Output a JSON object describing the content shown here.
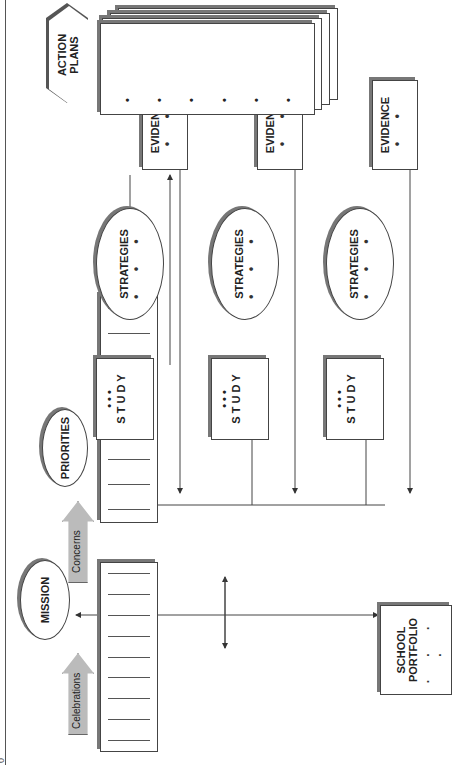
{
  "diagram": {
    "orientation": "rotated 90 degrees counter-clockwise",
    "mission": {
      "label": "MISSION"
    },
    "priorities": {
      "label": "PRIORITIES"
    },
    "celebrations": {
      "label": "Celebrations"
    },
    "concerns": {
      "label": "Concerns"
    },
    "school_portfolio": {
      "line1": "SCHOOL",
      "line2": "PORTFOLIO",
      "dots": ". . . ."
    },
    "rows": [
      {
        "study": {
          "letters": [
            "S",
            "T",
            "U",
            "D",
            "Y"
          ],
          "dots": "• • •"
        },
        "strategies": {
          "label": "STRATEGIES",
          "dots": "• • •"
        },
        "evidence": {
          "label": "EVIDENCE",
          "dots": "• •"
        }
      },
      {
        "study": {
          "letters": [
            "S",
            "T",
            "U",
            "D",
            "Y"
          ],
          "dots": "• • •"
        },
        "strategies": {
          "label": "STRATEGIES",
          "dots": "• • •"
        },
        "evidence": {
          "label": "EVIDENCE",
          "dots": "• •"
        }
      },
      {
        "study": {
          "letters": [
            "S",
            "T",
            "U",
            "D",
            "Y"
          ],
          "dots": "• • •"
        },
        "strategies": {
          "label": "STRATEGIES",
          "dots": "• • •"
        },
        "evidence": {
          "label": "EVIDENCE",
          "dots": "• •"
        }
      }
    ],
    "action_plans": {
      "line1": "ACTION",
      "line2": "PLANS",
      "bullets": [
        "•",
        "•",
        "•",
        "•",
        "•",
        "•"
      ]
    },
    "page_number": "0"
  }
}
